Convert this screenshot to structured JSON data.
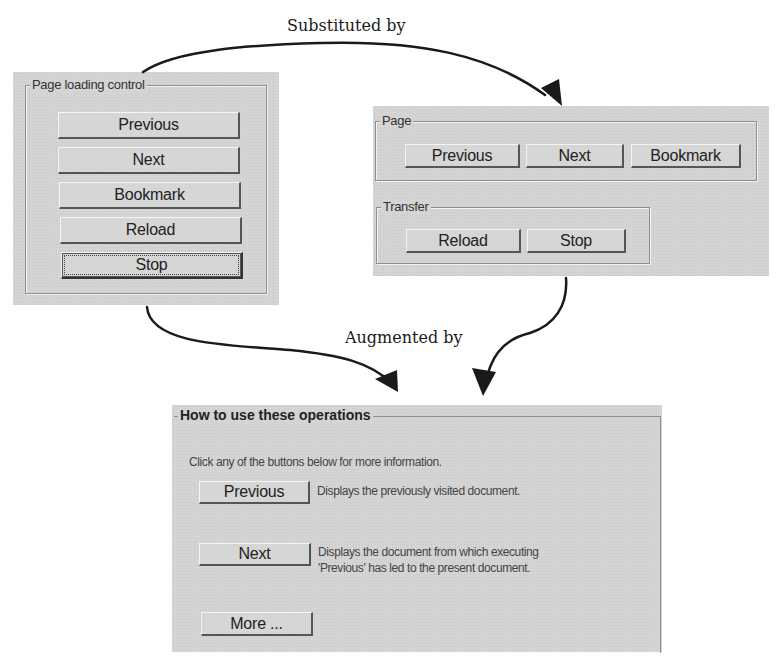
{
  "captions": {
    "substituted": "Substituted by",
    "augmented": "Augmented by"
  },
  "left_panel": {
    "legend": "Page loading control",
    "buttons": [
      {
        "label": "Previous"
      },
      {
        "label": "Next"
      },
      {
        "label": "Bookmark"
      },
      {
        "label": "Reload"
      },
      {
        "label": "Stop",
        "focused": true
      }
    ]
  },
  "right_panel": {
    "page_group": {
      "legend": "Page",
      "buttons": [
        {
          "label": "Previous"
        },
        {
          "label": "Next"
        },
        {
          "label": "Bookmark"
        }
      ]
    },
    "transfer_group": {
      "legend": "Transfer",
      "buttons": [
        {
          "label": "Reload"
        },
        {
          "label": "Stop"
        }
      ]
    }
  },
  "help_panel": {
    "legend": "How to use these operations",
    "intro": "Click any of the buttons below for more information.",
    "items": [
      {
        "button": "Previous",
        "description_lines": [
          "Displays the previously visited document."
        ]
      },
      {
        "button": "Next",
        "description_lines": [
          "Displays the document from which executing",
          "'Previous' has led to the present document."
        ]
      }
    ],
    "more_button": "More ..."
  },
  "colors": {
    "panel_bg": "#d4d4d4",
    "arrow": "#1a1a1a"
  }
}
